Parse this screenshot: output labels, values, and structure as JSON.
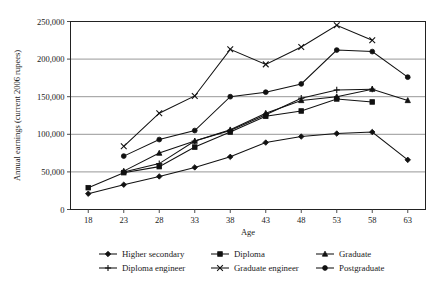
{
  "chart_data": {
    "type": "line",
    "title": "",
    "xlabel": "Age",
    "ylabel": "Annual earnings (current 2006 rupees)",
    "x": [
      18,
      23,
      28,
      33,
      38,
      43,
      48,
      53,
      58,
      63
    ],
    "xticklabels": [
      "18",
      "23",
      "28",
      "33",
      "38",
      "43",
      "48",
      "53",
      "58",
      "63"
    ],
    "yticks": [
      0,
      50000,
      100000,
      150000,
      200000,
      250000
    ],
    "yticklabels": [
      "0",
      "50,000",
      "100,000",
      "150,000",
      "200,000",
      "250,000"
    ],
    "xlim": [
      15.5,
      65.5
    ],
    "ylim": [
      0,
      250000
    ],
    "grid": "horizontal",
    "legend_position": "bottom",
    "legend_columns": 3,
    "series": [
      {
        "name": "Higher secondary",
        "marker": "diamond",
        "values": [
          21000,
          33000,
          44000,
          56000,
          70000,
          89000,
          97000,
          101000,
          103000,
          66000
        ]
      },
      {
        "name": "Diploma",
        "marker": "square",
        "values": [
          29000,
          49000,
          57000,
          83000,
          103000,
          124000,
          131000,
          147000,
          143000,
          null
        ]
      },
      {
        "name": "Graduate",
        "marker": "triangle",
        "values": [
          null,
          51000,
          75000,
          91000,
          106000,
          128000,
          145000,
          150000,
          160000,
          145000
        ]
      },
      {
        "name": "Diploma engineer",
        "marker": "plus",
        "values": [
          null,
          50000,
          61000,
          91000,
          105000,
          126000,
          148000,
          159000,
          160000,
          null
        ]
      },
      {
        "name": "Graduate engineer",
        "marker": "cross",
        "values": [
          null,
          84000,
          128000,
          151000,
          213000,
          193000,
          216000,
          245000,
          225000,
          null
        ]
      },
      {
        "name": "Postgraduate",
        "marker": "circle",
        "values": [
          null,
          71000,
          93000,
          105000,
          150000,
          156000,
          167000,
          212000,
          210000,
          176000
        ]
      }
    ],
    "colors": {
      "line": "#111111",
      "grid": "#8c8c8c",
      "frame": "#222222",
      "text": "#1a1a1a",
      "background": "#ffffff"
    }
  }
}
